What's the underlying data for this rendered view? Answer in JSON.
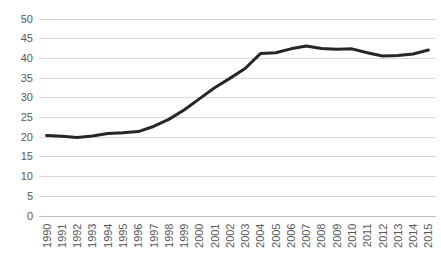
{
  "chart_data": {
    "type": "line",
    "title": "",
    "subtitle": "",
    "xlabel": "",
    "ylabel": "",
    "grid": true,
    "legend": false,
    "legend_position": "none",
    "line_color": "#262626",
    "gridline_color": "#d9d9d9",
    "axis_color": "#bfbfbf",
    "tick_label_color": "#595959",
    "xtick_rotation": -90,
    "ylim": [
      0,
      50
    ],
    "yticks": [
      0,
      5,
      10,
      15,
      20,
      25,
      30,
      35,
      40,
      45,
      50
    ],
    "ytick_labels": [
      "0",
      "5",
      "10",
      "15",
      "20",
      "25",
      "30",
      "35",
      "40",
      "45",
      "50"
    ],
    "categories": [
      "1990",
      "1991",
      "1992",
      "1993",
      "1994",
      "1995",
      "1996",
      "1997",
      "1998",
      "1999",
      "2000",
      "2001",
      "2002",
      "2003",
      "2004",
      "2005",
      "2006",
      "2007",
      "2008",
      "2009",
      "2010",
      "2011",
      "2012",
      "2013",
      "2014",
      "2015"
    ],
    "series": [
      {
        "name": "series-1",
        "values": [
          20.3,
          20.1,
          19.8,
          20.2,
          20.8,
          21.0,
          21.3,
          22.6,
          24.4,
          26.8,
          29.6,
          32.4,
          34.8,
          37.3,
          41.1,
          41.3,
          42.3,
          43.0,
          42.4,
          42.2,
          42.3,
          41.3,
          40.5,
          40.6,
          41.0,
          42.0
        ]
      }
    ]
  }
}
